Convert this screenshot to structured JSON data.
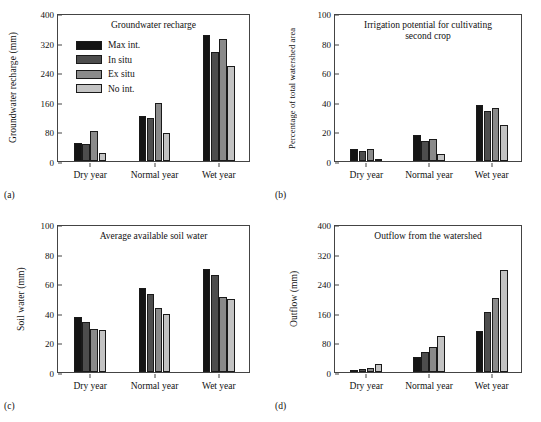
{
  "figure": {
    "series_names": [
      "Max int.",
      "In situ",
      "Ex situ",
      "No int."
    ],
    "series_colors": [
      "#141414",
      "#4d4d4d",
      "#8a8a8a",
      "#c3c3c3"
    ],
    "categories": [
      "Dry year",
      "Normal year",
      "Wet year"
    ]
  },
  "panels": {
    "a": {
      "letter": "(a)",
      "title": "Groundwater recharge",
      "ylabel": "Groundwater recharge (mm)",
      "yticks": [
        "0",
        "80",
        "160",
        "240",
        "320",
        "400"
      ],
      "has_legend": true
    },
    "b": {
      "letter": "(b)",
      "title_line1": "Irrigation potential for cultivating",
      "title_line2": "second crop",
      "ylabel": "Percentage of total watershed area",
      "yticks": [
        "0",
        "20",
        "40",
        "60",
        "80",
        "100"
      ],
      "has_legend": false
    },
    "c": {
      "letter": "(c)",
      "title": "Average available soil water",
      "ylabel": "Soil water (mm)",
      "yticks": [
        "0",
        "20",
        "40",
        "60",
        "80",
        "100"
      ],
      "has_legend": false
    },
    "d": {
      "letter": "(d)",
      "title": "Outflow from the watershed",
      "ylabel": "Outflow (mm)",
      "yticks": [
        "0",
        "80",
        "160",
        "240",
        "320",
        "400"
      ],
      "has_legend": false
    }
  },
  "chart_data": [
    {
      "type": "bar",
      "panel": "a",
      "title": "Groundwater recharge",
      "xlabel": "",
      "ylabel": "Groundwater recharge (mm)",
      "ylim": [
        0,
        400
      ],
      "yticks": [
        0,
        80,
        160,
        240,
        320,
        400
      ],
      "grid": false,
      "legend_position": "upper-left",
      "categories": [
        "Dry year",
        "Normal year",
        "Wet year"
      ],
      "series": [
        {
          "name": "Max int.",
          "values": [
            48,
            123,
            340
          ]
        },
        {
          "name": "In situ",
          "values": [
            45,
            115,
            295
          ]
        },
        {
          "name": "Ex situ",
          "values": [
            82,
            157,
            330
          ]
        },
        {
          "name": "No int.",
          "values": [
            23,
            77,
            256
          ]
        }
      ]
    },
    {
      "type": "bar",
      "panel": "b",
      "title": "Irrigation potential for cultivating second crop",
      "xlabel": "",
      "ylabel": "Percentage of total watershed area",
      "ylim": [
        0,
        100
      ],
      "yticks": [
        0,
        20,
        40,
        60,
        80,
        100
      ],
      "grid": false,
      "legend_position": "none",
      "categories": [
        "Dry year",
        "Normal year",
        "Wet year"
      ],
      "series": [
        {
          "name": "Max int.",
          "values": [
            8,
            17.5,
            38
          ]
        },
        {
          "name": "In situ",
          "values": [
            6.5,
            13.5,
            34
          ]
        },
        {
          "name": "Ex situ",
          "values": [
            8,
            15,
            36
          ]
        },
        {
          "name": "No int.",
          "values": [
            0.6,
            4.5,
            24
          ]
        }
      ]
    },
    {
      "type": "bar",
      "panel": "c",
      "title": "Average available soil water",
      "xlabel": "",
      "ylabel": "Soil water (mm)",
      "ylim": [
        0,
        100
      ],
      "yticks": [
        0,
        20,
        40,
        60,
        80,
        100
      ],
      "grid": false,
      "legend_position": "none",
      "categories": [
        "Dry year",
        "Normal year",
        "Wet year"
      ],
      "series": [
        {
          "name": "Max int.",
          "values": [
            37.5,
            56.5,
            69.5
          ]
        },
        {
          "name": "In situ",
          "values": [
            34,
            53,
            65.5
          ]
        },
        {
          "name": "Ex situ",
          "values": [
            29,
            43,
            50.5
          ]
        },
        {
          "name": "No int.",
          "values": [
            28.5,
            39.5,
            49.5
          ]
        }
      ]
    },
    {
      "type": "bar",
      "panel": "d",
      "title": "Outflow from the watershed",
      "xlabel": "",
      "ylabel": "Outflow (mm)",
      "ylim": [
        0,
        400
      ],
      "yticks": [
        0,
        80,
        160,
        240,
        320,
        400
      ],
      "grid": false,
      "legend_position": "none",
      "categories": [
        "Dry year",
        "Normal year",
        "Wet year"
      ],
      "series": [
        {
          "name": "Max int.",
          "values": [
            4,
            40,
            110
          ]
        },
        {
          "name": "In situ",
          "values": [
            7,
            53,
            161
          ]
        },
        {
          "name": "Ex situ",
          "values": [
            10,
            68,
            200
          ]
        },
        {
          "name": "No int.",
          "values": [
            22,
            98,
            277
          ]
        }
      ]
    }
  ]
}
